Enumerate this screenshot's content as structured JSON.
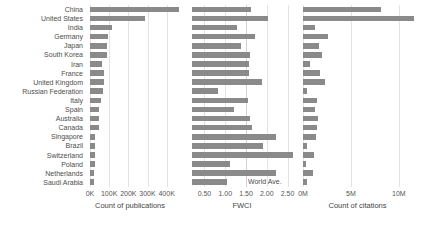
{
  "chart_data": {
    "type": "bar",
    "title": "",
    "orientation": "horizontal",
    "categories": [
      "China",
      "United States",
      "India",
      "Germany",
      "Japan",
      "South Korea",
      "Iran",
      "France",
      "United Kingdom",
      "Russian Federation",
      "Italy",
      "Spain",
      "Australia",
      "Canada",
      "Singapore",
      "Brazil",
      "Switzerland",
      "Poland",
      "Netherlands",
      "Saudi Arabia"
    ],
    "panels": [
      {
        "id": "publications",
        "xlabel": "Count of publications",
        "ticks": [
          "0K",
          "100K",
          "200K",
          "300K",
          "400K"
        ],
        "tick_values": [
          0,
          100000,
          200000,
          300000,
          400000
        ],
        "xlim": [
          0,
          480000
        ],
        "grid": true,
        "values": [
          463000,
          288000,
          117000,
          92000,
          90000,
          88000,
          62000,
          72000,
          72000,
          68000,
          59000,
          49000,
          46000,
          45000,
          26000,
          25000,
          24000,
          24000,
          22000,
          21000
        ]
      },
      {
        "id": "fwci",
        "xlabel": "FWCI",
        "ticks": [
          "0.50",
          "1.00",
          "1.50",
          "2.00",
          "2.50"
        ],
        "tick_values": [
          0.5,
          1.0,
          1.5,
          2.0,
          2.5
        ],
        "xlim": [
          0.2,
          2.8
        ],
        "grid": true,
        "reference_line": {
          "label": "World Ave.",
          "value": 1.5
        },
        "values": [
          1.62,
          2.02,
          1.28,
          1.72,
          1.37,
          1.6,
          1.57,
          1.57,
          1.88,
          0.82,
          1.55,
          1.22,
          1.6,
          1.64,
          2.22,
          1.9,
          2.63,
          1.12,
          2.22,
          1.05
        ]
      },
      {
        "id": "citations",
        "xlabel": "Count of citations",
        "ticks": [
          "0M",
          "5M",
          "10M"
        ],
        "tick_values": [
          0,
          5000000,
          10000000
        ],
        "xlim": [
          0,
          12200000
        ],
        "grid": true,
        "values": [
          8100000,
          11600000,
          1300000,
          2600000,
          1700000,
          2000000,
          700000,
          1800000,
          2300000,
          400000,
          1500000,
          1200000,
          1550000,
          1500000,
          1400000,
          400000,
          1100000,
          300000,
          1000000,
          400000
        ]
      }
    ],
    "ylabel": "",
    "legend": null,
    "bar_color": "#8a8a8a",
    "grid_color": "#e3e3e3",
    "text_color": "#4d4d4d"
  }
}
